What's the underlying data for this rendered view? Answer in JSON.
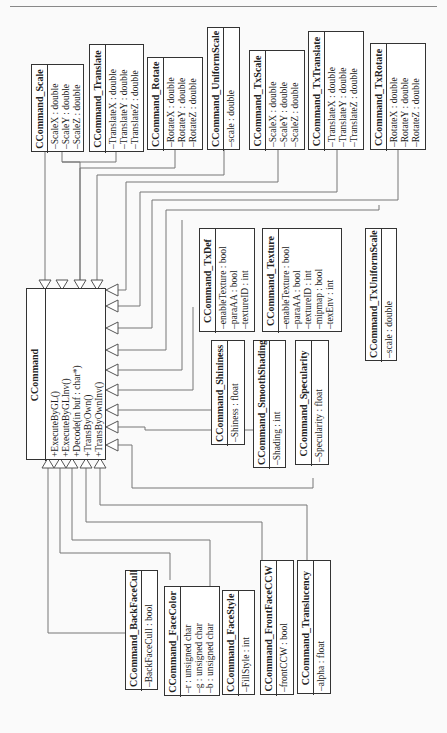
{
  "diagram": {
    "type": "uml-class-diagram",
    "orientation": "rotated-90-ccw",
    "base_class": {
      "name": "CCommand",
      "methods": [
        "+ExecuteByGL()",
        "+ExecuteByGLInv()",
        "+Decode(in buf : char*)",
        "+TransByOwn()",
        "+TransByOwnInv()"
      ]
    },
    "classes": [
      {
        "id": "scale",
        "name": "CCommand_Scale",
        "attrs": [
          "–ScaleX : double",
          "–ScaleY : double",
          "–ScaleZ : double"
        ]
      },
      {
        "id": "translate",
        "name": "CCommand_Translate",
        "attrs": [
          "–TranslateX : double",
          "–TranslateY : double",
          "–TranslateZ : double"
        ]
      },
      {
        "id": "rotate",
        "name": "CCommand_Rotate",
        "attrs": [
          "–RotateX : double",
          "–RotateY : double",
          "–RotateZ : double"
        ]
      },
      {
        "id": "uniformscale",
        "name": "CCommand_UniformScale",
        "attrs": [
          "–scale : double"
        ]
      },
      {
        "id": "txscale",
        "name": "CCommand_TxScale",
        "attrs": [
          "–ScaleX : double",
          "–ScaleY : double",
          "–ScaleZ : double"
        ]
      },
      {
        "id": "txtranslate",
        "name": "CCommand_TxTranslate",
        "attrs": [
          "–TranslateX : double",
          "–TranslateY : double",
          "–TranslateZ : double"
        ]
      },
      {
        "id": "txrotate",
        "name": "CCommand_TxRotate",
        "attrs": [
          "–RotateX : double",
          "–RotateY : double",
          "–RotateZ : double"
        ]
      },
      {
        "id": "txdef",
        "name": "CCommand_TxDef",
        "attrs": [
          "–enableTexture : bool",
          "–paraAA : bool",
          "–textureID : int"
        ]
      },
      {
        "id": "texture",
        "name": "CCommand_Texture",
        "attrs": [
          "–enableTexture : bool",
          "–paraAA : bool",
          "–textureID : int",
          "–mipmap : bool",
          "–texEnv : int"
        ]
      },
      {
        "id": "txuniformscale",
        "name": "CCommand_TxUniformScale",
        "attrs": [
          "–scale : double"
        ]
      },
      {
        "id": "shininess",
        "name": "CCommand_Shininess",
        "attrs": [
          "–Shiness : float"
        ]
      },
      {
        "id": "smoothshading",
        "name": "CCommand_SmoothShading",
        "attrs": [
          "–Shading : int"
        ]
      },
      {
        "id": "specularity",
        "name": "CCommand_Specularity",
        "attrs": [
          "–Specularity : float"
        ]
      },
      {
        "id": "backfacecull",
        "name": "CCommand_BackFaceCull",
        "attrs": [
          "–BackFaceCull : bool"
        ]
      },
      {
        "id": "facecolor",
        "name": "CCommand_FaceColor",
        "attrs": [
          "–r : unsigned char",
          "–g : unsigned char",
          "–b : unsigned char"
        ]
      },
      {
        "id": "facestyle",
        "name": "CCommand_FaceStyle",
        "attrs": [
          "–FillStyle : int"
        ]
      },
      {
        "id": "frontfaceccw",
        "name": "CCommand_FrontFaceCCW",
        "attrs": [
          "–frontCCW : bool"
        ]
      },
      {
        "id": "translucency",
        "name": "CCommand_Translucency",
        "attrs": [
          "–alpha : float"
        ]
      }
    ]
  }
}
